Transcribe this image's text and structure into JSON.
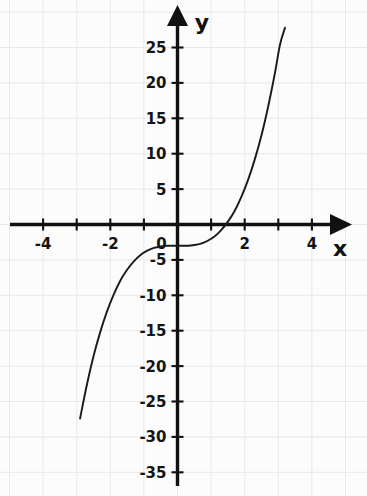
{
  "chart_data": {
    "type": "line",
    "title": "",
    "subtitle": "",
    "xlabel": "x",
    "ylabel": "y",
    "equation": "y = x^3 - 3",
    "xlim": [
      -4.6,
      4.6
    ],
    "ylim": [
      -37,
      29
    ],
    "grid": true,
    "grid_x_step": 1,
    "grid_y_step": 5,
    "legend": null,
    "legend_position": "none",
    "x_ticks": [
      -4,
      -3,
      -2,
      -1,
      0,
      1,
      2,
      3,
      4
    ],
    "x_tick_labels": [
      "-4",
      "",
      "-2",
      "",
      "0",
      "",
      "2",
      "",
      "4"
    ],
    "y_ticks": [
      25,
      20,
      15,
      10,
      5,
      -5,
      -10,
      -15,
      -20,
      -25,
      -30,
      -35
    ],
    "y_tick_labels": [
      "25",
      "20",
      "15",
      "10",
      "5",
      "-5",
      "-10",
      "-15",
      "-20",
      "-25",
      "-30",
      "-35"
    ],
    "x": [
      -2.9,
      -2.7,
      -2.5,
      -2.3,
      -2.1,
      -1.9,
      -1.7,
      -1.5,
      -1.3,
      -1.1,
      -0.9,
      -0.7,
      -0.5,
      -0.3,
      -0.1,
      0.1,
      0.3,
      0.5,
      0.7,
      0.9,
      1.1,
      1.3,
      1.5,
      1.7,
      1.9,
      2.1,
      2.3,
      2.5,
      2.7,
      2.9,
      3.05,
      3.2
    ],
    "y": [
      -27.4,
      -22.7,
      -18.6,
      -15.2,
      -12.3,
      -9.9,
      -7.9,
      -6.4,
      -5.2,
      -4.3,
      -3.7,
      -3.3,
      -3.1,
      -3.0,
      -3.0,
      -3.0,
      -3.0,
      -2.9,
      -2.7,
      -2.3,
      -1.7,
      -0.8,
      0.4,
      1.9,
      3.9,
      6.3,
      9.2,
      12.6,
      16.7,
      21.4,
      25.4,
      27.8
    ],
    "series": [
      {
        "name": "y = x^3 - 3",
        "x_start": -2.9,
        "x_end": 3.2,
        "color": "#1a1a1a"
      }
    ],
    "annotations": [
      {
        "name": "y-intercept",
        "x": 0,
        "y": -3
      },
      {
        "name": "x-intercept",
        "x": 1.442,
        "y": 0
      }
    ],
    "axis_colors": {
      "axis": "#111111",
      "grid": "#e9e9ec",
      "curve": "#1a1a1a",
      "background": "#fcfcfc"
    }
  }
}
